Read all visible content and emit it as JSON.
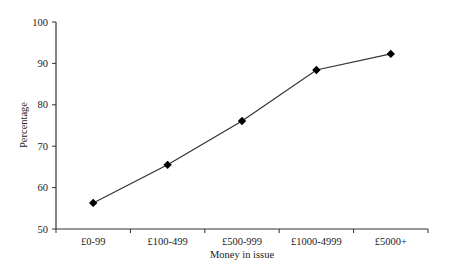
{
  "chart_data": {
    "type": "line",
    "title": "",
    "xlabel": "Money in issue",
    "ylabel": "Percentage",
    "categories": [
      "£0-99",
      "£100-499",
      "£500-999",
      "£1000-4999",
      "£5000+"
    ],
    "series": [
      {
        "name": "Percentage",
        "values": [
          56.3,
          65.5,
          76.1,
          88.4,
          92.3
        ],
        "marker": "diamond",
        "color": "#000000"
      }
    ],
    "ylim": [
      50,
      100
    ],
    "yticks": [
      50,
      60,
      70,
      80,
      90,
      100
    ],
    "grid": false,
    "legend": null
  },
  "colors": {
    "line": "#333333",
    "marker": "#000000",
    "axis": "#333333",
    "text": "#222222",
    "background": "#ffffff"
  }
}
